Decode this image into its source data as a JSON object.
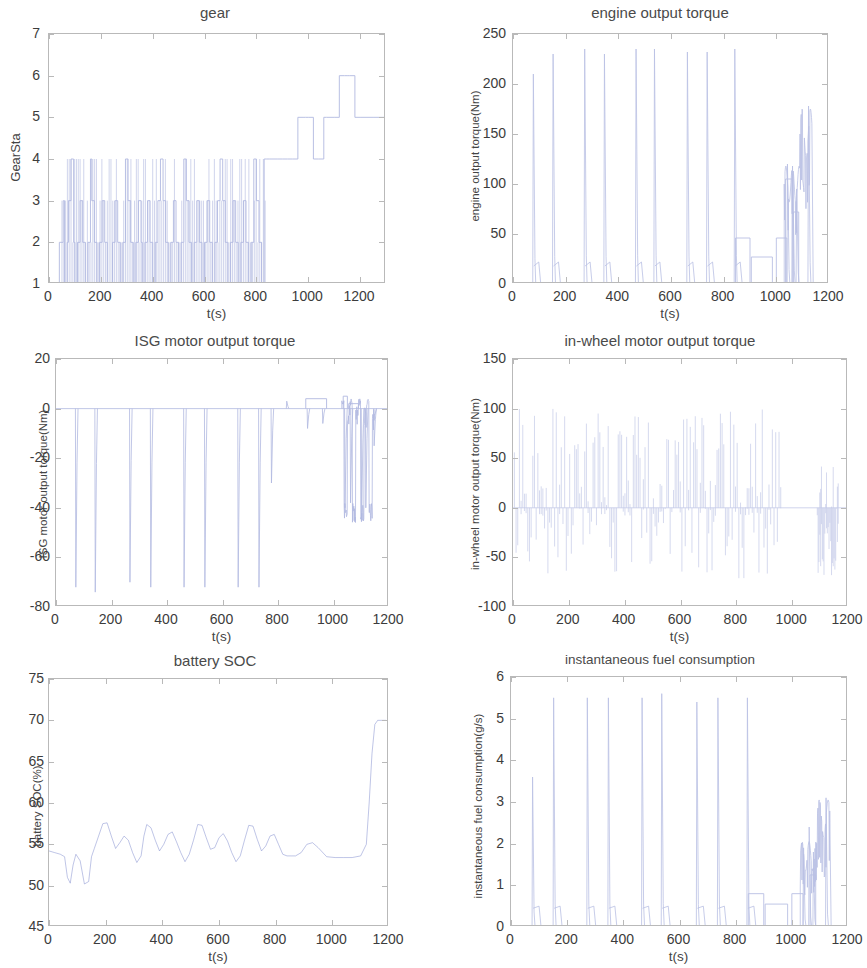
{
  "figure": {
    "background": "#ffffff",
    "line_color": "#6675c4",
    "axis_color": "#b9b9b9",
    "text_color": "#3c3c3c"
  },
  "charts": [
    {
      "id": "gear",
      "type": "line",
      "title": "gear",
      "xlabel": "t(s)",
      "ylabel": "GearSta",
      "xlim": [
        0,
        1300
      ],
      "ylim": [
        1,
        7
      ],
      "xticks": [
        0,
        200,
        400,
        600,
        800,
        1000,
        1200
      ],
      "yticks": [
        1,
        2,
        3,
        4,
        5,
        6,
        7
      ],
      "grid": false,
      "x": [
        0,
        20,
        40,
        55,
        60,
        70,
        75,
        85,
        95,
        100,
        110,
        120,
        130,
        140,
        150,
        160,
        165,
        175,
        185,
        195,
        205,
        215,
        225,
        235,
        245,
        255,
        265,
        275,
        285,
        295,
        305,
        315,
        325,
        335,
        345,
        355,
        360,
        370,
        380,
        390,
        400,
        410,
        420,
        430,
        440,
        450,
        460,
        470,
        480,
        490,
        500,
        510,
        520,
        530,
        540,
        550,
        560,
        570,
        580,
        590,
        600,
        610,
        620,
        630,
        640,
        650,
        660,
        670,
        680,
        690,
        700,
        710,
        720,
        730,
        740,
        750,
        760,
        770,
        780,
        790,
        800,
        810,
        820,
        830,
        840,
        850,
        860,
        880,
        900,
        920,
        940,
        960,
        980,
        990,
        1000,
        1020,
        1040,
        1060,
        1070,
        1080,
        1100,
        1120,
        1140,
        1150,
        1160,
        1180,
        1200,
        1250,
        1300
      ],
      "y": [
        1,
        1,
        2,
        3,
        1,
        2,
        3,
        4,
        2,
        1,
        2,
        3,
        2,
        1,
        2,
        4,
        3,
        2,
        1,
        2,
        3,
        2,
        1,
        1,
        2,
        3,
        2,
        1,
        2,
        4,
        3,
        2,
        1,
        2,
        3,
        2,
        1,
        2,
        3,
        2,
        1,
        2,
        3,
        4,
        3,
        2,
        1,
        2,
        3,
        2,
        1,
        2,
        4,
        3,
        2,
        1,
        2,
        3,
        2,
        1,
        2,
        3,
        2,
        1,
        2,
        3,
        4,
        3,
        2,
        1,
        2,
        3,
        2,
        1,
        2,
        3,
        2,
        1,
        2,
        4,
        3,
        2,
        1,
        4,
        4,
        4,
        4,
        4,
        4,
        4,
        4,
        5,
        5,
        5,
        5,
        4,
        4,
        5,
        5,
        5,
        5,
        6,
        6,
        6,
        6,
        5,
        5,
        5,
        5
      ],
      "description": "Gear state steps rapidly between gears 1-4 for t<840s, then holds 4, rises to 5 around 880-980, dips to 4, then 5, peaks at 6 near 1080-1140, ends at 5."
    },
    {
      "id": "engine_output_torque",
      "type": "line",
      "title": "engine output torque",
      "xlabel": "t(s)",
      "ylabel": "engine output torque(Nm)",
      "xlim": [
        0,
        1200
      ],
      "ylim": [
        0,
        250
      ],
      "xticks": [
        0,
        200,
        400,
        600,
        800,
        1000,
        1200
      ],
      "yticks": [
        0,
        50,
        100,
        150,
        200,
        250
      ],
      "grid": false,
      "spikes_x": [
        75,
        150,
        270,
        345,
        465,
        535,
        660,
        735,
        840,
        1040,
        1060,
        1075,
        1120
      ],
      "spikes_y": [
        210,
        230,
        235,
        230,
        235,
        235,
        232,
        232,
        235,
        120,
        110,
        95,
        178
      ],
      "plateaus": [
        {
          "x0": 845,
          "x1": 900,
          "y": 46
        },
        {
          "x0": 905,
          "x1": 985,
          "y": 27
        },
        {
          "x0": 1000,
          "x1": 1040,
          "y": 46
        },
        {
          "x0": 1065,
          "x1": 1085,
          "y": 72
        },
        {
          "x0": 1035,
          "x1": 1060,
          "y": 105
        }
      ],
      "description": "Mostly zero with narrow spikes to ~210-235 Nm at engine-on events; plateaus near 27-46 Nm between 845-1040s; cluster near 100-178 Nm between 1035-1130s."
    },
    {
      "id": "isg_motor_output_torque",
      "type": "line",
      "title": "ISG motor output torque",
      "xlabel": "t(s)",
      "ylabel": "ISG motor output torque(Nm)",
      "xlim": [
        0,
        1200
      ],
      "ylim": [
        -80,
        20
      ],
      "xticks": [
        0,
        200,
        400,
        600,
        800,
        1000,
        1200
      ],
      "yticks": [
        -80,
        -60,
        -40,
        -20,
        0,
        20
      ],
      "grid": false,
      "spikes_x": [
        70,
        140,
        265,
        340,
        460,
        535,
        655,
        730,
        775,
        830,
        905,
        960,
        1040,
        1060,
        1100,
        1115,
        1145
      ],
      "spikes_y": [
        -72,
        -74,
        -70,
        -72,
        -72,
        -72,
        -72,
        -72,
        -30,
        3,
        -8,
        -6,
        -40,
        -38,
        -45,
        -40,
        -15
      ],
      "plateaus": [
        {
          "x0": 900,
          "x1": 975,
          "y": 4
        },
        {
          "x0": 1035,
          "x1": 1050,
          "y": 5
        },
        {
          "x0": 1055,
          "x1": 1090,
          "y": 2
        }
      ],
      "description": "Near 0 baseline with deep negative spikes to about -70 to -75 Nm at start events; active region 900-1150s oscillating between +5 and -45 Nm."
    },
    {
      "id": "in_wheel_motor_output_torque",
      "type": "line",
      "title": "in-wheel motor output torque",
      "xlabel": "t(s)",
      "ylabel": "in-wheel motor output torque(Nm)",
      "xlim": [
        0,
        1200
      ],
      "ylim": [
        -100,
        150
      ],
      "xticks": [
        0,
        200,
        400,
        600,
        800,
        1000,
        1200
      ],
      "yticks": [
        -100,
        -50,
        0,
        50,
        100,
        150
      ],
      "grid": false,
      "upper_limit": 100,
      "lower_typical": -65,
      "description": "Dense alternation between +100 Nm traction peaks and -65 Nm regenerative dips across 0-900s; flat at 0 between ~960-1100s; final burst to ~+45 and -70 Nm near 1100-1160s."
    },
    {
      "id": "battery_soc",
      "type": "line",
      "title": "battery SOC",
      "xlabel": "t(s)",
      "ylabel": "battery SOC(%)",
      "xlim": [
        0,
        1200
      ],
      "ylim": [
        45,
        75
      ],
      "xticks": [
        0,
        200,
        400,
        600,
        800,
        1000,
        1200
      ],
      "yticks": [
        45,
        50,
        55,
        60,
        65,
        70,
        75
      ],
      "grid": false,
      "x": [
        0,
        20,
        40,
        55,
        65,
        75,
        85,
        95,
        110,
        125,
        140,
        150,
        160,
        175,
        190,
        205,
        220,
        235,
        250,
        265,
        280,
        295,
        310,
        325,
        335,
        345,
        360,
        375,
        390,
        405,
        420,
        435,
        450,
        465,
        480,
        495,
        510,
        525,
        540,
        555,
        570,
        585,
        600,
        615,
        630,
        645,
        660,
        675,
        690,
        705,
        720,
        735,
        750,
        765,
        780,
        795,
        810,
        825,
        840,
        855,
        870,
        890,
        910,
        930,
        950,
        980,
        1010,
        1040,
        1070,
        1100,
        1120,
        1130,
        1140,
        1150,
        1160,
        1175,
        1190
      ],
      "y": [
        54.2,
        54.0,
        53.8,
        53.5,
        51.0,
        50.3,
        52.5,
        53.8,
        53.0,
        50.2,
        50.5,
        53.5,
        54.5,
        56.0,
        57.5,
        57.6,
        56.0,
        54.5,
        55.2,
        56.0,
        55.5,
        54.0,
        52.8,
        53.6,
        56.0,
        57.4,
        57.0,
        55.5,
        54.2,
        55.0,
        56.2,
        56.5,
        55.3,
        54.0,
        52.9,
        53.8,
        55.5,
        57.4,
        57.3,
        55.8,
        54.4,
        54.6,
        55.8,
        56.3,
        55.4,
        54.0,
        52.9,
        53.6,
        55.5,
        57.3,
        57.2,
        55.6,
        54.2,
        54.8,
        56.0,
        56.2,
        55.0,
        53.8,
        53.6,
        53.6,
        53.6,
        54.0,
        55.0,
        55.2,
        54.6,
        53.5,
        53.4,
        53.4,
        53.4,
        53.6,
        55.0,
        60.0,
        66.0,
        69.5,
        70.0,
        70.0,
        70.0
      ],
      "description": "State of charge oscillates between ~50% and ~58% with charge/discharge cycles, settles near 53.5% from 840-1120s, then climbs steeply to ~70% after 1120s."
    },
    {
      "id": "instantaneous_fuel_consumption",
      "type": "line",
      "title": "instantaneous fuel consumption",
      "xlabel": "t(s)",
      "ylabel": "instantaneous fuel consumption(g/s)",
      "xlim": [
        0,
        1200
      ],
      "ylim": [
        0,
        6
      ],
      "xticks": [
        0,
        200,
        400,
        600,
        800,
        1000,
        1200
      ],
      "yticks": [
        0,
        1,
        2,
        3,
        4,
        5,
        6
      ],
      "grid": false,
      "spikes_x": [
        75,
        150,
        270,
        345,
        465,
        535,
        660,
        735,
        840,
        1040,
        1060,
        1075,
        1120
      ],
      "spikes_y": [
        3.6,
        5.5,
        5.5,
        5.5,
        5.5,
        5.6,
        5.4,
        5.5,
        5.5,
        1.9,
        2.4,
        1.8,
        3.1
      ],
      "plateaus": [
        {
          "x0": 845,
          "x1": 900,
          "y": 0.8
        },
        {
          "x0": 905,
          "x1": 985,
          "y": 0.55
        },
        {
          "x0": 1000,
          "x1": 1040,
          "y": 0.8
        },
        {
          "x0": 1065,
          "x1": 1085,
          "y": 1.25
        }
      ],
      "description": "Zero baseline with tall spikes to ~5.5 g/s when engine fires; small plateaus 0.55-1.25 g/s between 845-1090s; final cluster peaks near 3.1 g/s at 1120s."
    }
  ]
}
